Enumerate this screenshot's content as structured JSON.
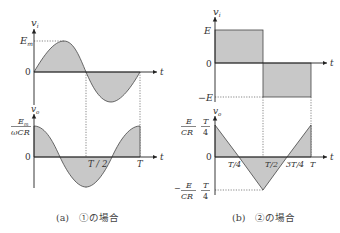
{
  "panel_a": {
    "caption": "(a)　①の場合",
    "top_plot": {
      "y_label": "v",
      "y_label_sub": "i",
      "x_label": "t",
      "ticks_y": [
        "E",
        "0"
      ],
      "ticks_y_sub": [
        "m",
        ""
      ],
      "shape": "sine"
    },
    "bottom_plot": {
      "y_label": "v",
      "y_label_sub": "o",
      "x_label": "t",
      "amp_num": "E",
      "amp_num_sub": "m",
      "amp_den": "ωCR",
      "zero": "0",
      "ticks_x": [
        "T / 2",
        "T"
      ],
      "shape": "cosine"
    }
  },
  "panel_b": {
    "caption": "(b)　②の場合",
    "top_plot": {
      "y_label": "v",
      "y_label_sub": "i",
      "x_label": "t",
      "ticks_y": [
        "E",
        "0",
        "−E"
      ],
      "shape": "square"
    },
    "bottom_plot": {
      "y_label": "v",
      "y_label_sub": "o",
      "x_label": "t",
      "pos_amp": {
        "num_left": "E",
        "num_right": "T",
        "den_left": "CR",
        "den_right": "4"
      },
      "neg_amp": {
        "sign": "−",
        "num_left": "E",
        "num_right": "T",
        "den_left": "CR",
        "den_right": "4"
      },
      "zero": "0",
      "ticks_x": [
        "T/4",
        "T/2",
        "3T/4",
        "T"
      ],
      "shape": "triangle"
    }
  },
  "colors": {
    "fill": "#c8c8c8",
    "stroke": "#444444",
    "axis": "#222222"
  }
}
